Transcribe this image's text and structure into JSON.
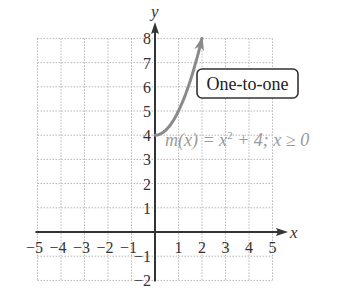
{
  "chart_data": {
    "type": "line",
    "title": "",
    "xlabel": "x",
    "ylabel": "y",
    "xlim": [
      -5,
      5
    ],
    "ylim": [
      -2,
      8
    ],
    "grid": true,
    "x_ticks": [
      -5,
      -4,
      -3,
      -2,
      -1,
      1,
      2,
      3,
      4,
      5
    ],
    "x_tick_labels": [
      "−5",
      "−4",
      "−3",
      "−2",
      "−1",
      "1",
      "2",
      "3",
      "4",
      "5"
    ],
    "y_ticks": [
      -2,
      -1,
      1,
      2,
      3,
      4,
      5,
      6,
      7,
      8
    ],
    "y_tick_labels": [
      "−2",
      "−1",
      "1",
      "2",
      "3",
      "4",
      "5",
      "6",
      "7",
      "8"
    ],
    "series": [
      {
        "name": "m(x) = x² + 4; x ≥ 0",
        "function": "x^2 + 4",
        "domain": [
          0,
          2
        ],
        "x": [
          0,
          0.25,
          0.5,
          0.75,
          1,
          1.25,
          1.5,
          1.75,
          2
        ],
        "y": [
          4,
          4.0625,
          4.25,
          4.5625,
          5,
          5.5625,
          6.25,
          7.0625,
          8
        ],
        "start_point": "closed",
        "end": "arrow",
        "color": "#8a8a8a"
      }
    ],
    "annotations": [
      {
        "text": "One-to-one",
        "type": "boxed-label",
        "position": [
          2,
          6.2
        ]
      },
      {
        "text_parts": [
          "m(x) = x",
          "2",
          " + 4; x ≥ 0"
        ],
        "type": "function-label",
        "position": [
          0.5,
          3.5
        ]
      }
    ]
  },
  "labels": {
    "x_axis": "x",
    "y_axis": "y",
    "badge": "One-to-one",
    "func_pre": "m(x) = x",
    "func_sup": "2",
    "func_post": " + 4; x ≥ 0"
  },
  "colors": {
    "axis": "#333333",
    "grid": "#b8b8b8",
    "curve": "#8a8a8a",
    "function_label": "#9a9a9a",
    "text": "#333333"
  }
}
